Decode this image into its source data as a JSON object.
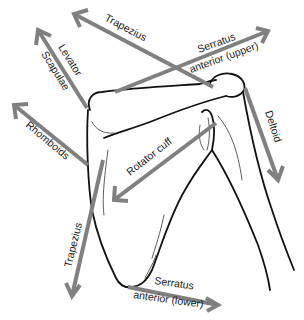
{
  "diagram": {
    "subject": "scapula",
    "colors": {
      "arrow": "#808080",
      "bone_outline": "#111111",
      "label_text": "#1a1a1a",
      "background": "#ffffff"
    },
    "labels": {
      "trapezius_upper": "Trapezius",
      "levator_line1": "Levator",
      "levator_line2": "Scapulae",
      "serratus_upper_line1": "Serratus",
      "serratus_upper_line2": "anterior (upper)",
      "rhomboids": "Rhomboids",
      "deltoid": "Deltoid",
      "rotator_cuff": "Rotator cuff",
      "trapezius_lower": "Trapezius",
      "serratus_lower_line1": "Serratus",
      "serratus_lower_line2": "anterior (lower)"
    },
    "arrows": [
      {
        "muscle": "Trapezius (upper)",
        "from": [
          213,
          87
        ],
        "to": [
          72,
          13
        ]
      },
      {
        "muscle": "Levator Scapulae",
        "from": [
          87,
          108
        ],
        "to": [
          36,
          28
        ]
      },
      {
        "muscle": "Serratus anterior (upper)",
        "from": [
          115,
          92
        ],
        "to": [
          270,
          30
        ]
      },
      {
        "muscle": "Rhomboids",
        "from": [
          88,
          165
        ],
        "to": [
          12,
          103
        ]
      },
      {
        "muscle": "Deltoid",
        "from": [
          245,
          87
        ],
        "to": [
          278,
          182
        ]
      },
      {
        "muscle": "Rotator cuff",
        "from": [
          216,
          123
        ],
        "to": [
          112,
          202
        ]
      },
      {
        "muscle": "Trapezius (lower)",
        "from": [
          103,
          160
        ],
        "to": [
          72,
          298
        ]
      },
      {
        "muscle": "Serratus anterior (lower)",
        "from": [
          128,
          287
        ],
        "to": [
          220,
          306
        ]
      }
    ]
  }
}
